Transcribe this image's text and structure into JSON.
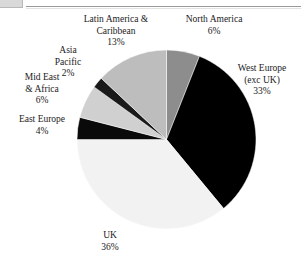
{
  "figure": {
    "background_color": "#ffffff",
    "corner_mark_color": "#d9d9d9",
    "rule_color": "#9a9a9a"
  },
  "chart_data": {
    "type": "pie",
    "title": "",
    "subtitle": "",
    "xlabel": "",
    "ylabel": "",
    "legend_position": "none",
    "grid": false,
    "units": "percent",
    "start_angle_deg": 0,
    "direction": "clockwise",
    "categories": [
      "North America",
      "West Europe (exc UK)",
      "UK",
      "East Europe",
      "Mid East & Africa",
      "Asia Pacific",
      "Latin America & Caribbean"
    ],
    "values": [
      6,
      33,
      36,
      4,
      6,
      2,
      13
    ],
    "colors": [
      "#8d8d8d",
      "#000000",
      "#f2f2f2",
      "#0a0a0a",
      "#d0d0d0",
      "#1a1a1a",
      "#bdbdbd"
    ],
    "slices": [
      {
        "name": "North America",
        "value": 6,
        "pct_label": "6%",
        "color": "#8d8d8d"
      },
      {
        "name": "West Europe (exc UK)",
        "value": 33,
        "pct_label": "33%",
        "color": "#000000"
      },
      {
        "name": "UK",
        "value": 36,
        "pct_label": "36%",
        "color": "#f2f2f2"
      },
      {
        "name": "East Europe",
        "value": 4,
        "pct_label": "4%",
        "color": "#0a0a0a"
      },
      {
        "name": "Mid East & Africa",
        "value": 6,
        "pct_label": "6%",
        "color": "#d0d0d0"
      },
      {
        "name": "Asia Pacific",
        "value": 2,
        "pct_label": "2%",
        "color": "#1a1a1a"
      },
      {
        "name": "Latin America & Caribbean",
        "value": 13,
        "pct_label": "13%",
        "color": "#bdbdbd"
      }
    ]
  },
  "labels": {
    "latin_america": {
      "line1": "Latin America &",
      "line2": "Caribbean",
      "pct": "13%"
    },
    "north_america": {
      "line1": "North America",
      "pct": "6%"
    },
    "asia_pacific": {
      "line1": "Asia",
      "line2": "Pacific",
      "pct": "2%"
    },
    "mid_east_africa": {
      "line1": "Mid East",
      "line2": "& Africa",
      "pct": "6%"
    },
    "east_europe": {
      "line1": "East Europe",
      "pct": "4%"
    },
    "west_europe": {
      "line1": "West Europe",
      "line2": "(exc UK)",
      "pct": "33%"
    },
    "uk": {
      "line1": "UK",
      "pct": "36%"
    }
  }
}
